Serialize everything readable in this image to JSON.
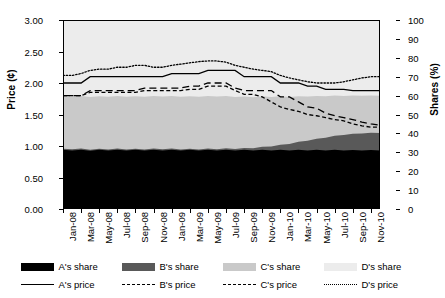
{
  "chart_data": {
    "type": "area",
    "title": "",
    "xlabel": "",
    "ylabel": "Price (¢)",
    "y2label": "Shares (%)",
    "ylim": [
      0,
      3
    ],
    "y2lim": [
      0,
      100
    ],
    "grid": false,
    "legend_position": "bottom",
    "x_tick_labels": [
      "Jan-08",
      "Mar-08",
      "May-08",
      "Jul-08",
      "Sep-08",
      "Nov-08",
      "Jan-09",
      "Mar-09",
      "May-09",
      "Jul-09",
      "Sep-09",
      "Nov-09",
      "Jan-10",
      "Mar-10",
      "May-10",
      "Jul-10",
      "Sep-10",
      "Nov-10"
    ],
    "y_tick_labels": [
      "0.00",
      "0.50",
      "1.00",
      "1.50",
      "2.00",
      "2.50",
      "3.00"
    ],
    "y2_tick_labels": [
      "0",
      "10",
      "20",
      "30",
      "40",
      "50",
      "60",
      "70",
      "80",
      "90",
      "100"
    ],
    "x": [
      "Jan-08",
      "Feb-08",
      "Mar-08",
      "Apr-08",
      "May-08",
      "Jun-08",
      "Jul-08",
      "Aug-08",
      "Sep-08",
      "Oct-08",
      "Nov-08",
      "Dec-08",
      "Jan-09",
      "Feb-09",
      "Mar-09",
      "Apr-09",
      "May-09",
      "Jun-09",
      "Jul-09",
      "Aug-09",
      "Sep-09",
      "Oct-09",
      "Nov-09",
      "Dec-09",
      "Jan-10",
      "Feb-10",
      "Mar-10",
      "Apr-10",
      "May-10",
      "Jun-10",
      "Jul-10",
      "Aug-10",
      "Sep-10",
      "Oct-10",
      "Nov-10",
      "Dec-10"
    ],
    "share_series": [
      {
        "name": "A's share",
        "color": "#000000",
        "values": [
          31.3,
          31.0,
          31.4,
          30.8,
          31.3,
          30.9,
          31.4,
          30.9,
          31.3,
          30.9,
          31.4,
          31.0,
          31.4,
          30.9,
          31.3,
          30.9,
          31.4,
          31.0,
          31.4,
          30.9,
          31.3,
          30.9,
          31.4,
          31.0,
          31.3,
          30.9,
          31.3,
          31.0,
          31.3,
          31.0,
          31.3,
          31.0,
          31.2,
          31.0,
          31.2,
          31.0
        ]
      },
      {
        "name": "B's share",
        "color": "#595959",
        "values": [
          0.6,
          0.6,
          0.6,
          0.6,
          0.6,
          0.6,
          0.6,
          0.6,
          0.6,
          0.6,
          0.6,
          0.6,
          0.6,
          0.6,
          0.6,
          0.6,
          0.6,
          0.6,
          0.7,
          0.8,
          1.0,
          1.3,
          1.6,
          2.1,
          2.7,
          3.5,
          4.3,
          5.1,
          5.9,
          6.7,
          7.5,
          8.1,
          8.6,
          8.9,
          9.1,
          9.2
        ]
      },
      {
        "name": "C's share",
        "color": "#c9c9c9",
        "values": [
          27.8,
          27.9,
          27.8,
          27.9,
          27.8,
          27.9,
          27.8,
          27.9,
          27.8,
          27.9,
          27.8,
          27.9,
          27.8,
          27.9,
          27.8,
          27.9,
          27.8,
          27.9,
          27.7,
          27.5,
          27.2,
          26.9,
          26.6,
          26.1,
          25.6,
          24.8,
          24.1,
          23.4,
          22.6,
          21.9,
          21.2,
          20.7,
          20.3,
          20.0,
          19.8,
          19.7
        ]
      },
      {
        "name": "D's share",
        "color": "#ececec",
        "values": [
          40.3,
          40.5,
          40.2,
          40.7,
          40.3,
          40.6,
          40.2,
          40.6,
          40.3,
          40.6,
          40.2,
          40.5,
          40.2,
          40.6,
          40.3,
          40.6,
          40.2,
          40.5,
          40.2,
          40.8,
          40.5,
          40.9,
          40.4,
          40.8,
          40.4,
          40.8,
          40.3,
          40.5,
          40.2,
          40.4,
          40.0,
          40.2,
          39.9,
          40.1,
          39.9,
          40.1
        ]
      }
    ],
    "price_series": [
      {
        "name": "A's price",
        "style": "solid",
        "values": [
          2.0,
          2.0,
          2.0,
          2.1,
          2.1,
          2.1,
          2.1,
          2.1,
          2.1,
          2.1,
          2.1,
          2.1,
          2.15,
          2.15,
          2.15,
          2.15,
          2.2,
          2.2,
          2.2,
          2.2,
          2.1,
          2.1,
          2.1,
          2.1,
          2.0,
          2.0,
          2.0,
          1.95,
          1.95,
          1.9,
          1.9,
          1.9,
          1.88,
          1.88,
          1.88,
          1.88
        ]
      },
      {
        "name": "B's price",
        "style": "dashed",
        "values": [
          1.8,
          1.8,
          1.8,
          1.88,
          1.88,
          1.88,
          1.88,
          1.88,
          1.88,
          1.92,
          1.92,
          1.92,
          1.92,
          1.92,
          1.95,
          1.95,
          2.0,
          2.0,
          2.0,
          1.92,
          1.88,
          1.88,
          1.88,
          1.88,
          1.78,
          1.78,
          1.7,
          1.62,
          1.6,
          1.52,
          1.48,
          1.45,
          1.42,
          1.38,
          1.35,
          1.33
        ]
      },
      {
        "name": "C's price",
        "style": "dashed-short",
        "values": [
          1.8,
          1.8,
          1.8,
          1.85,
          1.85,
          1.85,
          1.85,
          1.85,
          1.85,
          1.88,
          1.88,
          1.88,
          1.88,
          1.88,
          1.9,
          1.9,
          1.95,
          1.95,
          1.95,
          1.88,
          1.82,
          1.82,
          1.78,
          1.7,
          1.62,
          1.58,
          1.55,
          1.5,
          1.48,
          1.45,
          1.42,
          1.4,
          1.35,
          1.32,
          1.3,
          1.3
        ]
      },
      {
        "name": "D's price",
        "style": "dotted",
        "values": [
          2.12,
          2.12,
          2.15,
          2.2,
          2.22,
          2.22,
          2.25,
          2.25,
          2.28,
          2.28,
          2.25,
          2.25,
          2.28,
          2.3,
          2.32,
          2.34,
          2.35,
          2.35,
          2.33,
          2.28,
          2.25,
          2.22,
          2.2,
          2.18,
          2.12,
          2.08,
          2.05,
          2.02,
          2.0,
          2.0,
          2.0,
          2.02,
          2.05,
          2.08,
          2.1,
          2.1
        ]
      }
    ]
  },
  "legend": {
    "shares": [
      {
        "label": "A's share",
        "color": "#000000"
      },
      {
        "label": "B's share",
        "color": "#595959"
      },
      {
        "label": "C's share",
        "color": "#c9c9c9"
      },
      {
        "label": "D's share",
        "color": "#ececec"
      }
    ],
    "prices": [
      {
        "label": "A's price",
        "style": "solid"
      },
      {
        "label": "B's price",
        "style": "dashed"
      },
      {
        "label": "C's price",
        "style": "dashed-short"
      },
      {
        "label": "D's price",
        "style": "dotted"
      }
    ]
  }
}
